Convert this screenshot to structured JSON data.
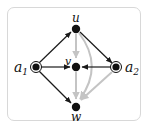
{
  "diagram": {
    "type": "directed-graph",
    "colors": {
      "frame_border": "#d8d8d8",
      "node_fill": "#111111",
      "black_edge": "#1a1a1a",
      "gray_edge": "#c4c4c4"
    },
    "nodes": [
      {
        "id": "u",
        "label": "u",
        "x": 76,
        "y": 29,
        "style": "filled"
      },
      {
        "id": "v",
        "label": "v",
        "x": 76,
        "y": 67,
        "style": "filled"
      },
      {
        "id": "w",
        "label": "w",
        "x": 76,
        "y": 107,
        "style": "filled"
      },
      {
        "id": "a1",
        "label": "a",
        "subscript": "1",
        "x": 36,
        "y": 67,
        "style": "double-circle"
      },
      {
        "id": "a2",
        "label": "a",
        "subscript": "2",
        "x": 116,
        "y": 67,
        "style": "double-circle"
      }
    ],
    "edges": [
      {
        "from": "a1",
        "to": "u",
        "color": "black"
      },
      {
        "from": "a1",
        "to": "v",
        "color": "black"
      },
      {
        "from": "a1",
        "to": "w",
        "color": "black"
      },
      {
        "from": "u",
        "to": "a2",
        "color": "black"
      },
      {
        "from": "a2",
        "to": "v",
        "color": "black"
      },
      {
        "from": "v",
        "to": "w",
        "color": "black"
      },
      {
        "from": "u",
        "to": "v",
        "color": "gray"
      },
      {
        "from": "u",
        "to": "w",
        "color": "gray",
        "curved": true
      },
      {
        "from": "a2",
        "to": "w",
        "color": "gray"
      }
    ],
    "labels": {
      "u": "u",
      "v": "v",
      "w": "w",
      "a1_main": "a",
      "a1_sub": "1",
      "a2_main": "a",
      "a2_sub": "2"
    }
  }
}
